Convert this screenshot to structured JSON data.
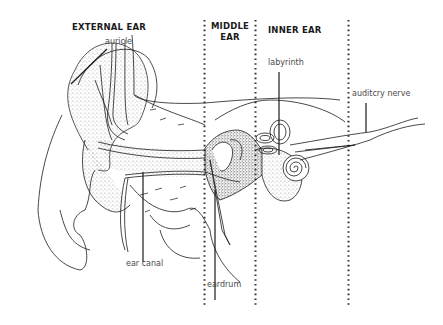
{
  "diagram": {
    "sections": [
      {
        "id": "external",
        "title": "EXTERNAL EAR"
      },
      {
        "id": "middle",
        "title_line1": "MIDDLE",
        "title_line2": "EAR"
      },
      {
        "id": "inner",
        "title": "INNER EAR"
      }
    ],
    "labels": {
      "auricle": "auricle",
      "labyrinth": "labyrinth",
      "auditory_nerve": "auditcry nerve",
      "ear_canal": "ear canal",
      "eardrum": "eardrum"
    },
    "colors": {
      "ink": "#1a1a1a",
      "label_text": "#4a4a4a",
      "background": "#ffffff"
    }
  }
}
